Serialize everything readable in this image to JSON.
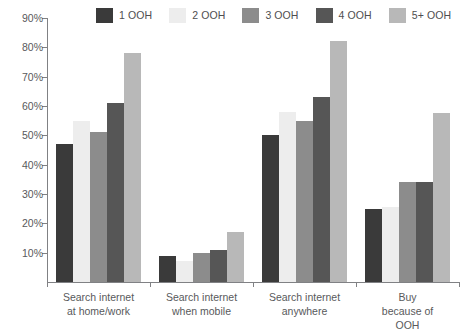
{
  "chart_data": {
    "type": "bar",
    "title": "",
    "subtitle": "",
    "xlabel": "",
    "ylabel": "",
    "ylim": [
      0,
      90
    ],
    "y_tick_labels": [
      "0%",
      "10%",
      "20%",
      "30%",
      "40%",
      "50%",
      "60%",
      "70%",
      "80%",
      "90%"
    ],
    "y_ticks": [
      0,
      10,
      20,
      30,
      40,
      50,
      60,
      70,
      80,
      90
    ],
    "grid": false,
    "legend_position": "top",
    "categories": [
      "Search internet\nat home/work",
      "Search internet\nwhen mobile",
      "Search internet\nanywhere",
      "Buy because of OOH"
    ],
    "series": [
      {
        "name": "1 OOH",
        "color": "#3a3a3a",
        "values": [
          47,
          9,
          50,
          25
        ]
      },
      {
        "name": "2 OOH",
        "color": "#ededed",
        "values": [
          55,
          7,
          58,
          25.5
        ]
      },
      {
        "name": "3 OOH",
        "color": "#8c8c8c",
        "values": [
          51,
          10,
          55,
          34
        ]
      },
      {
        "name": "4 OOH",
        "color": "#565656",
        "values": [
          61,
          11,
          63,
          34
        ]
      },
      {
        "name": "5+ OOH",
        "color": "#b8b8b8",
        "values": [
          78,
          17,
          82,
          57.5
        ]
      }
    ]
  },
  "axis": {
    "line_color": "#808184",
    "text_color": "#58595b"
  }
}
